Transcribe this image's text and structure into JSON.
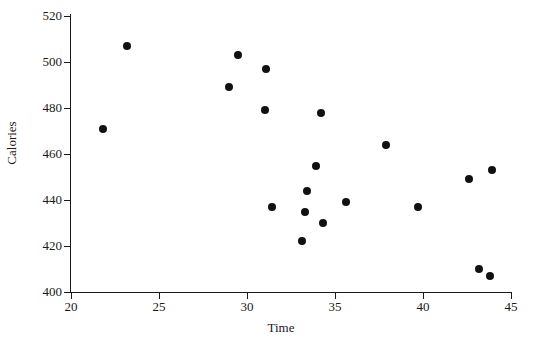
{
  "chart_data": {
    "type": "scatter",
    "title": "",
    "xlabel": "Time",
    "ylabel": "Calories",
    "xlim": [
      20,
      45
    ],
    "ylim": [
      400,
      520
    ],
    "xticks": [
      20,
      25,
      30,
      35,
      40,
      45
    ],
    "yticks": [
      400,
      420,
      440,
      460,
      480,
      500,
      520
    ],
    "grid": false,
    "legend": null,
    "marker": {
      "shape": "circle",
      "color": "#111111",
      "size": 8
    },
    "n_points": 20,
    "x": [
      21.8,
      23.2,
      29.0,
      29.5,
      31.0,
      31.1,
      31.4,
      33.1,
      33.3,
      33.4,
      33.9,
      34.2,
      34.3,
      35.6,
      37.9,
      39.7,
      42.6,
      43.2,
      43.8,
      43.9
    ],
    "y": [
      471,
      507,
      489,
      503,
      479,
      497,
      437,
      422,
      435,
      444,
      455,
      478,
      430,
      439,
      464,
      437,
      449,
      410,
      407,
      453
    ],
    "points": [
      {
        "x": 21.8,
        "y": 471
      },
      {
        "x": 23.2,
        "y": 507
      },
      {
        "x": 29.0,
        "y": 489
      },
      {
        "x": 29.5,
        "y": 503
      },
      {
        "x": 31.0,
        "y": 479
      },
      {
        "x": 31.1,
        "y": 497
      },
      {
        "x": 31.4,
        "y": 437
      },
      {
        "x": 33.1,
        "y": 422
      },
      {
        "x": 33.3,
        "y": 435
      },
      {
        "x": 33.4,
        "y": 444
      },
      {
        "x": 33.9,
        "y": 455
      },
      {
        "x": 34.2,
        "y": 478
      },
      {
        "x": 34.3,
        "y": 430
      },
      {
        "x": 35.6,
        "y": 439
      },
      {
        "x": 37.9,
        "y": 464
      },
      {
        "x": 39.7,
        "y": 437
      },
      {
        "x": 42.6,
        "y": 449
      },
      {
        "x": 43.2,
        "y": 410
      },
      {
        "x": 43.8,
        "y": 407
      },
      {
        "x": 43.9,
        "y": 453
      }
    ]
  },
  "axes": {
    "x_title": "Time",
    "y_title": "Calories",
    "x_tick_labels": [
      "20",
      "25",
      "30",
      "35",
      "40",
      "45"
    ],
    "y_tick_labels": [
      "400",
      "420",
      "440",
      "460",
      "480",
      "500",
      "520"
    ]
  },
  "colors": {
    "marker": "#111111",
    "axis": "#1a1a1a",
    "background": "#ffffff"
  }
}
